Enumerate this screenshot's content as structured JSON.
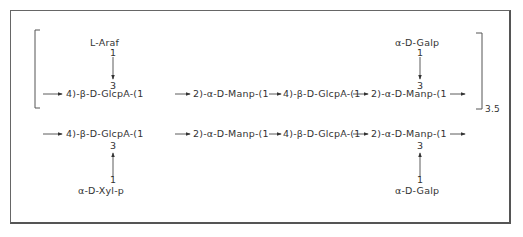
{
  "diagram": {
    "type": "polysaccharide-structure",
    "repeat_unit": {
      "repeat_count": "3.5",
      "backbone": [
        "4)-β-D-GlcpA-(1",
        "2)-α-D-Manp-(1",
        "4)-β-D-GlcpA-(1",
        "2)-α-D-Manp-(1"
      ],
      "branches": [
        {
          "label": "L-Araf",
          "from_pos": "1",
          "to_pos": "3",
          "attached_to_index": 0
        },
        {
          "label": "α-D-Galp",
          "from_pos": "1",
          "to_pos": "3",
          "attached_to_index": 3
        }
      ]
    },
    "terminal_unit": {
      "backbone": [
        "4)-β-D-GlcpA-(1",
        "2)-α-D-Manp-(1",
        "4)-β-D-GlcpA-(1",
        "2)-α-D-Manp-(1"
      ],
      "branches": [
        {
          "label": "α-D-Xyl-p",
          "from_pos": "1",
          "to_pos": "3",
          "attached_to_index": 0
        },
        {
          "label": "α-D-Galp",
          "from_pos": "1",
          "to_pos": "3",
          "attached_to_index": 3
        }
      ]
    },
    "labels": {
      "r1_b0": "4)-β-D-GlcpA-(1",
      "r1_b1": "2)-α-D-Manp-(1",
      "r1_b2": "4)-β-D-GlcpA-(1",
      "r1_b3": "2)-α-D-Manp-(1",
      "r1_branch_left": "L-Araf",
      "r1_branch_right": "α-D-Galp",
      "r2_b0": "4)-β-D-GlcpA-(1",
      "r2_b1": "2)-α-D-Manp-(1",
      "r2_b2": "4)-β-D-GlcpA-(1",
      "r2_b3": "2)-α-D-Manp-(1",
      "r2_branch_left": "α-D-Xyl-p",
      "r2_branch_right": "α-D-Galp",
      "pos_one": "1",
      "pos_three": "3",
      "repeat_subscript": "3.5"
    }
  }
}
